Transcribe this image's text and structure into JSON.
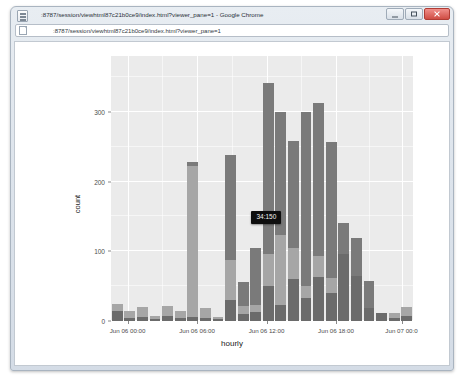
{
  "window": {
    "title": ":8787/session/viewhtml87c21b0ce9/index.html?viewer_pane=1 - Google Chrome",
    "favicon_name": "page-favicon",
    "minimize_label": "Minimize",
    "maximize_label": "Maximize",
    "close_label": "Close"
  },
  "omnibox": {
    "url": ":8787/session/viewhtml87c21b0ce9/index.html?viewer_pane=1",
    "placeholder": "Search Google or type a URL",
    "page_icon_name": "page-icon"
  },
  "tooltip": {
    "text": "34:150"
  },
  "chart_data": {
    "type": "bar",
    "title": "",
    "xlabel": "hourly",
    "ylabel": "count",
    "stacked": true,
    "grid": true,
    "legend": "none",
    "ylim": [
      0,
      380
    ],
    "yticks": [
      0,
      100,
      200,
      300
    ],
    "ytick_labels": [
      "0",
      "100",
      "200",
      "300"
    ],
    "xtick_labels": [
      "Jun 06 00:00",
      "Jun 06 06:00",
      "Jun 06 12:00",
      "Jun 06 18:00",
      "Jun 07 00:0"
    ],
    "xtick_positions": [
      0.055,
      0.285,
      0.515,
      0.745,
      0.962
    ],
    "categories": [
      "Jun 06 00:00",
      "Jun 06 01:00",
      "Jun 06 02:00",
      "Jun 06 03:00",
      "Jun 06 04:00",
      "Jun 06 05:00",
      "Jun 06 06:00",
      "Jun 06 07:00",
      "Jun 06 08:00",
      "Jun 06 09:00",
      "Jun 06 10:00",
      "Jun 06 11:00",
      "Jun 06 12:00",
      "Jun 06 13:00",
      "Jun 06 14:00",
      "Jun 06 15:00",
      "Jun 06 16:00",
      "Jun 06 17:00",
      "Jun 06 18:00",
      "Jun 06 19:00",
      "Jun 06 20:00",
      "Jun 06 21:00",
      "Jun 06 22:00",
      "Jun 06 23:00"
    ],
    "series": [
      {
        "name": "lower",
        "color": "#6b6b6b",
        "values": [
          14,
          5,
          6,
          3,
          7,
          4,
          6,
          5,
          3,
          30,
          10,
          13,
          50,
          23,
          60,
          33,
          63,
          40,
          96,
          65,
          18,
          12,
          5,
          7
        ]
      },
      {
        "name": "middle",
        "color": "#a6a6a6",
        "values": [
          11,
          9,
          14,
          4,
          15,
          10,
          216,
          14,
          3,
          58,
          12,
          10,
          46,
          100,
          45,
          17,
          30,
          22,
          0,
          0,
          0,
          0,
          7,
          13
        ]
      },
      {
        "name": "upper",
        "color": "#7a7a7a",
        "values": [
          0,
          0,
          0,
          0,
          0,
          0,
          6,
          0,
          0,
          150,
          34,
          82,
          246,
          177,
          153,
          250,
          220,
          195,
          45,
          54,
          40,
          0,
          0,
          0
        ]
      }
    ],
    "totals": [
      25,
      14,
      20,
      7,
      22,
      14,
      228,
      19,
      6,
      238,
      56,
      105,
      342,
      300,
      258,
      300,
      313,
      257,
      141,
      119,
      58,
      12,
      12,
      20
    ]
  }
}
